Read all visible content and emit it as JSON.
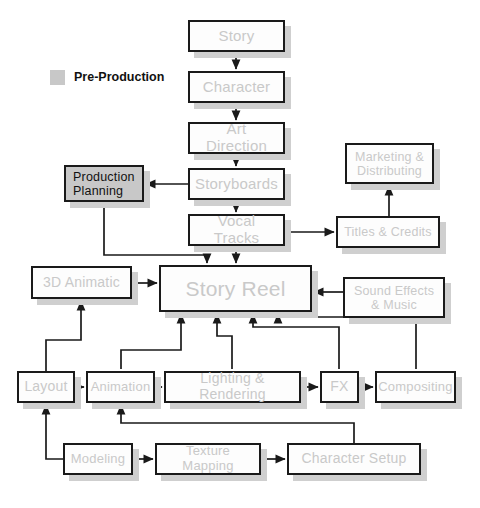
{
  "diagram": {
    "colors": {
      "node_border": "#1a1a1a",
      "node_fill": "#fdfdfd",
      "node_text": "#c9c9c9",
      "highlight_fill": "#c8c8c8",
      "highlight_text": "#111111",
      "shadow": "#cfcfcf",
      "wire": "#1a1a1a",
      "background": "#ffffff"
    },
    "legend": {
      "swatch_name": "pre-production-swatch",
      "label": "Pre-Production",
      "color": "#c8c8c8"
    },
    "nodes": [
      {
        "id": "story",
        "label": "Story",
        "x": 188,
        "y": 20,
        "w": 97,
        "h": 32,
        "font": 15,
        "highlight": false
      },
      {
        "id": "character",
        "label": "Character",
        "x": 188,
        "y": 71,
        "w": 97,
        "h": 32,
        "font": 15,
        "highlight": false
      },
      {
        "id": "art_direction",
        "label": "Art Direction",
        "x": 188,
        "y": 122,
        "w": 97,
        "h": 32,
        "font": 15,
        "highlight": false
      },
      {
        "id": "storyboards",
        "label": "Storyboards",
        "x": 188,
        "y": 168,
        "w": 97,
        "h": 32,
        "font": 15,
        "highlight": false
      },
      {
        "id": "vocal_tracks",
        "label": "Vocal Tracks",
        "x": 188,
        "y": 214,
        "w": 97,
        "h": 32,
        "font": 15,
        "highlight": false
      },
      {
        "id": "production_planning",
        "label": "Production\nPlanning",
        "x": 64,
        "y": 165,
        "w": 80,
        "h": 37,
        "font": 12.5,
        "highlight": true
      },
      {
        "id": "marketing",
        "label": "Marketing &\nDistributing",
        "x": 345,
        "y": 143,
        "w": 89,
        "h": 41,
        "font": 12.5,
        "highlight": false
      },
      {
        "id": "titles",
        "label": "Titles & Credits",
        "x": 336,
        "y": 216,
        "w": 104,
        "h": 32,
        "font": 12.5,
        "highlight": false
      },
      {
        "id": "animatic_3d",
        "label": "3D Animatic",
        "x": 31,
        "y": 266,
        "w": 101,
        "h": 33,
        "font": 14,
        "highlight": false
      },
      {
        "id": "story_reel",
        "label": "Story Reel",
        "x": 159,
        "y": 265,
        "w": 153,
        "h": 47,
        "font": 21,
        "highlight": false
      },
      {
        "id": "sound_effects",
        "label": "Sound Effects\n& Music",
        "x": 343,
        "y": 277,
        "w": 102,
        "h": 41,
        "font": 12.5,
        "highlight": false
      },
      {
        "id": "layout",
        "label": "Layout",
        "x": 17,
        "y": 371,
        "w": 58,
        "h": 32,
        "font": 14,
        "highlight": false
      },
      {
        "id": "animation",
        "label": "Animation",
        "x": 86,
        "y": 371,
        "w": 69,
        "h": 32,
        "font": 13,
        "highlight": false
      },
      {
        "id": "lighting",
        "label": "Lighting & Rendering",
        "x": 164,
        "y": 371,
        "w": 137,
        "h": 32,
        "font": 14,
        "highlight": false
      },
      {
        "id": "fx",
        "label": "FX",
        "x": 320,
        "y": 371,
        "w": 39,
        "h": 32,
        "font": 14,
        "highlight": false
      },
      {
        "id": "compositing",
        "label": "Compositing",
        "x": 375,
        "y": 371,
        "w": 81,
        "h": 32,
        "font": 13,
        "highlight": false
      },
      {
        "id": "modeling",
        "label": "Modeling",
        "x": 63,
        "y": 443,
        "w": 70,
        "h": 32,
        "font": 13,
        "highlight": false
      },
      {
        "id": "texture",
        "label": "Texture Mapping",
        "x": 155,
        "y": 443,
        "w": 106,
        "h": 32,
        "font": 13,
        "highlight": false
      },
      {
        "id": "char_setup",
        "label": "Character Setup",
        "x": 287,
        "y": 443,
        "w": 134,
        "h": 32,
        "font": 14,
        "highlight": false
      }
    ],
    "edges": [
      {
        "name": "story-to-character",
        "points": "236,52 236,69"
      },
      {
        "name": "character-to-art-direction",
        "points": "236,103 236,120"
      },
      {
        "name": "art-direction-to-storyboards",
        "points": "236,154 236,166"
      },
      {
        "name": "storyboards-to-production-planning",
        "points": "188,184 146,184"
      },
      {
        "name": "storyboards-to-vocal-tracks",
        "points": "236,200 236,212"
      },
      {
        "name": "vocal-tracks-to-story-reel",
        "points": "236,246 236,263"
      },
      {
        "name": "production-planning-to-story-reel",
        "points": "104,202 104,255 207,255 207,263"
      },
      {
        "name": "animatic-to-story-reel",
        "points": "132,283 157,283"
      },
      {
        "name": "sound-effects-to-story-reel",
        "points": "343,292 314,292"
      },
      {
        "name": "story-reel-to-titles",
        "points": "290,246 290,232 334,232"
      },
      {
        "name": "titles-to-marketing",
        "points": "389,216 389,186"
      },
      {
        "name": "layout-to-animatic",
        "points": "46,371 46,340 81,340 81,301"
      },
      {
        "name": "animation-to-story-reel",
        "points": "121,369 121,350 181,350 181,314"
      },
      {
        "name": "lighting-to-story-reel",
        "points": "232,369 232,336 217,336 217,314"
      },
      {
        "name": "fx-to-story-reel",
        "points": "339,369 339,327 253,327 253,314"
      },
      {
        "name": "compositing-to-story-reel",
        "points": "416,369 416,317 278,317 278,314"
      },
      {
        "name": "layout-to-animation",
        "points": "75,387 84,387"
      },
      {
        "name": "animation-to-lighting",
        "points": "155,387 162,387"
      },
      {
        "name": "lighting-to-fx",
        "points": "301,387 318,387"
      },
      {
        "name": "fx-to-compositing",
        "points": "359,387 373,387"
      },
      {
        "name": "modeling-to-layout",
        "points": "63,459 46,459 46,405"
      },
      {
        "name": "modeling-to-texture",
        "points": "133,459 153,459"
      },
      {
        "name": "texture-to-char-setup",
        "points": "261,459 285,459"
      },
      {
        "name": "char-setup-to-animation",
        "points": "354,443 354,423 121,423 121,405"
      }
    ]
  }
}
